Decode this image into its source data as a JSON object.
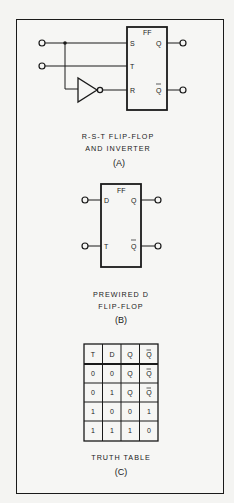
{
  "panel_a": {
    "ff_label": "FF",
    "pins": {
      "s": "S",
      "t": "T",
      "r": "R",
      "q": "Q",
      "qbar": "Q"
    },
    "caption_line1": "R-S-T FLIP-FLOP",
    "caption_line2": "AND INVERTER",
    "caption_id": "(A)"
  },
  "panel_b": {
    "ff_label": "FF",
    "pins": {
      "d": "D",
      "t": "T",
      "q": "Q",
      "qbar": "Q"
    },
    "caption_line1": "PREWIRED D",
    "caption_line2": "FLIP-FLOP",
    "caption_id": "(B)"
  },
  "panel_c": {
    "headers": [
      "T",
      "D",
      "Q",
      "Q"
    ],
    "rows": [
      [
        "0",
        "0",
        "Q",
        "Q"
      ],
      [
        "0",
        "1",
        "Q",
        "Q"
      ],
      [
        "1",
        "0",
        "0",
        "1"
      ],
      [
        "1",
        "1",
        "1",
        "0"
      ]
    ],
    "caption_line1": "TRUTH TABLE",
    "caption_id": "(C)"
  }
}
